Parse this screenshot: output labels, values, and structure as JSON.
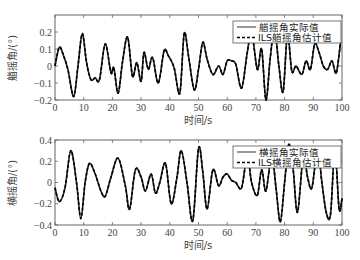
{
  "chart_data": [
    {
      "type": "line",
      "title": "",
      "xlabel": "时间/s",
      "ylabel": "艏摇角/(°)",
      "xlim": [
        0,
        100
      ],
      "ylim": [
        -0.2,
        0.3
      ],
      "xticks": [
        0,
        10,
        20,
        30,
        40,
        50,
        60,
        70,
        80,
        90,
        100
      ],
      "xtick_labels": [
        "0",
        "10",
        "20",
        "30",
        "40",
        "50",
        "60",
        "70",
        "80",
        "90",
        "100"
      ],
      "yticks": [
        -0.2,
        -0.1,
        0,
        0.1,
        0.2
      ],
      "ytick_labels": [
        "-0.2",
        "-0.1",
        "0",
        "0.1",
        "0.2"
      ],
      "grid": false,
      "legend_position": "upper right",
      "legend": [
        "艏摇角实际值",
        "ILS艏摇角估计值"
      ],
      "series": [
        {
          "name": "艏摇角实际值",
          "style": "solid",
          "x": [
            0,
            1.5,
            3,
            4.5,
            6.5,
            8,
            9.5,
            11,
            12.5,
            14,
            15.5,
            17.5,
            19.5,
            20.5,
            22,
            23.5,
            25.3,
            27,
            28.5,
            30,
            31,
            32.5,
            34,
            36,
            38,
            39.5,
            41.5,
            43.5,
            45,
            46.5,
            48.5,
            50,
            51.5,
            53,
            55,
            57,
            58.5,
            60,
            61.5,
            63,
            65,
            67,
            68.5,
            70.5,
            72,
            73.5,
            75,
            76.5,
            78,
            79.5,
            81,
            82.5,
            84,
            86,
            87.5,
            89,
            90.5,
            92,
            93.5,
            95,
            96.5,
            98,
            99.5
          ],
          "y": [
            0,
            0.11,
            0.06,
            -0.02,
            -0.18,
            0.0,
            0.19,
            0.02,
            -0.08,
            -0.07,
            -0.08,
            0.13,
            -0.04,
            -0.01,
            -0.16,
            0.02,
            0.17,
            -0.06,
            0.02,
            -0.09,
            0.08,
            -0.02,
            0.05,
            -0.1,
            0.09,
            0.06,
            -0.01,
            -0.16,
            0.19,
            0.06,
            -0.14,
            -0.02,
            0.14,
            0.04,
            -0.05,
            0.0,
            -0.05,
            0.03,
            0.03,
            0.01,
            -0.13,
            0.08,
            0.2,
            -0.02,
            0.1,
            -0.2,
            0.05,
            0.22,
            0.0,
            -0.15,
            0.19,
            -0.03,
            0.0,
            -0.05,
            0.03,
            -0.02,
            0.13,
            0.08,
            0.0,
            -0.02,
            0.03,
            -0.04,
            0.14
          ]
        },
        {
          "name": "ILS艏摇角估计值",
          "style": "dashed",
          "note": "overlaps actual values"
        }
      ]
    },
    {
      "type": "line",
      "title": "",
      "xlabel": "时间/s",
      "ylabel": "横摇角/(°)",
      "xlim": [
        0,
        100
      ],
      "ylim": [
        -0.4,
        0.4
      ],
      "xticks": [
        0,
        10,
        20,
        30,
        40,
        50,
        60,
        70,
        80,
        90,
        100
      ],
      "xtick_labels": [
        "0",
        "10",
        "20",
        "30",
        "40",
        "50",
        "60",
        "70",
        "80",
        "90",
        "100"
      ],
      "yticks": [
        -0.4,
        -0.2,
        0,
        0.2,
        0.4
      ],
      "ytick_labels": [
        "-0.4",
        "-0.2",
        "0",
        "0.2",
        "0.4"
      ],
      "grid": false,
      "legend_position": "upper right",
      "legend": [
        "横摇角实际值",
        "ILS横摇角估计值"
      ],
      "series": [
        {
          "name": "横摇角实际值",
          "style": "solid",
          "x": [
            0,
            1.5,
            3.5,
            5.5,
            7.5,
            9,
            10.5,
            12,
            14,
            16,
            17.5,
            19.5,
            22,
            24.5,
            26,
            28,
            30,
            31.5,
            33.5,
            35,
            36.5,
            38.5,
            40.5,
            42.5,
            44,
            46,
            48,
            50,
            51.5,
            53,
            55,
            57,
            58.5,
            60,
            61.5,
            63,
            65,
            67,
            68.5,
            70.5,
            72,
            73.5,
            75.5,
            77,
            78.5,
            80,
            81.5,
            83,
            84.5,
            86.5,
            88,
            89.5,
            91.5,
            93,
            94.5,
            96,
            97.5,
            99,
            100
          ],
          "y": [
            -0.05,
            -0.18,
            -0.05,
            0.3,
            0.0,
            -0.34,
            0.0,
            0.18,
            0.08,
            -0.08,
            -0.13,
            0.05,
            0.23,
            -0.03,
            -0.25,
            0.12,
            0.05,
            -0.08,
            0.08,
            -0.1,
            0.0,
            0.18,
            -0.2,
            0.05,
            0.3,
            0.0,
            -0.36,
            0.32,
            0.1,
            -0.25,
            0.12,
            -0.03,
            0.05,
            0.08,
            0.02,
            0.0,
            -0.05,
            0.25,
            0.0,
            -0.12,
            0.12,
            -0.08,
            0.25,
            -0.05,
            -0.37,
            0.0,
            0.36,
            0.12,
            -0.28,
            0.25,
            0.05,
            -0.05,
            0.3,
            0.0,
            -0.28,
            -0.3,
            0.3,
            -0.25,
            -0.15
          ]
        },
        {
          "name": "ILS横摇角估计值",
          "style": "dashed",
          "note": "overlaps actual values"
        }
      ]
    }
  ]
}
